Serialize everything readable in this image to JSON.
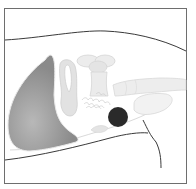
{
  "figure": {
    "type": "anatomical-illustration",
    "colors": {
      "background": "#ffffff",
      "frame": "#6e6e6e",
      "outline": "#3a3a3a",
      "dark_organ": "#8c8c8c",
      "dark_organ_highlight": "#b4b4b4",
      "light_structure": "#e6e6e6",
      "light_structure_stroke": "#cfcfcf",
      "dark_spot": "#2a2a2a"
    }
  }
}
